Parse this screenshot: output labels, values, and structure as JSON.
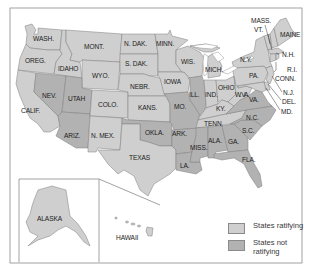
{
  "map": {
    "type": "choropleth",
    "subject": "United States",
    "colors": {
      "ratifying": "#cfcfcf",
      "not_ratifying": "#b2b2b2",
      "water": "#ffffff",
      "border": "#7c7c7c",
      "frame": "#8a8a8a"
    },
    "legend": {
      "items": [
        {
          "key": "ratifying",
          "label": "States ratifying"
        },
        {
          "key": "not_ratifying",
          "label": "States not ratifying"
        }
      ]
    },
    "states": [
      {
        "abbr": "WA",
        "label": "WASH.",
        "status": "ratifying"
      },
      {
        "abbr": "OR",
        "label": "OREG.",
        "status": "ratifying"
      },
      {
        "abbr": "CA",
        "label": "CALIF.",
        "status": "ratifying"
      },
      {
        "abbr": "ID",
        "label": "IDAHO",
        "status": "ratifying"
      },
      {
        "abbr": "NV",
        "label": "NEV.",
        "status": "not_ratifying"
      },
      {
        "abbr": "MT",
        "label": "MONT.",
        "status": "ratifying"
      },
      {
        "abbr": "WY",
        "label": "WYO.",
        "status": "ratifying"
      },
      {
        "abbr": "UT",
        "label": "UTAH",
        "status": "not_ratifying"
      },
      {
        "abbr": "AZ",
        "label": "ARIZ.",
        "status": "not_ratifying"
      },
      {
        "abbr": "CO",
        "label": "COLO.",
        "status": "ratifying"
      },
      {
        "abbr": "NM",
        "label": "N. MEX.",
        "status": "ratifying"
      },
      {
        "abbr": "ND",
        "label": "N. DAK.",
        "status": "ratifying"
      },
      {
        "abbr": "SD",
        "label": "S. DAK.",
        "status": "ratifying"
      },
      {
        "abbr": "NE",
        "label": "NEBR.",
        "status": "ratifying"
      },
      {
        "abbr": "KS",
        "label": "KANS.",
        "status": "ratifying"
      },
      {
        "abbr": "OK",
        "label": "OKLA.",
        "status": "not_ratifying"
      },
      {
        "abbr": "TX",
        "label": "TEXAS",
        "status": "ratifying"
      },
      {
        "abbr": "MN",
        "label": "MINN.",
        "status": "ratifying"
      },
      {
        "abbr": "IA",
        "label": "IOWA",
        "status": "ratifying"
      },
      {
        "abbr": "MO",
        "label": "MO.",
        "status": "not_ratifying"
      },
      {
        "abbr": "AR",
        "label": "ARK.",
        "status": "not_ratifying"
      },
      {
        "abbr": "LA",
        "label": "LA.",
        "status": "not_ratifying"
      },
      {
        "abbr": "WI",
        "label": "WIS.",
        "status": "ratifying"
      },
      {
        "abbr": "IL",
        "label": "ILL.",
        "status": "not_ratifying"
      },
      {
        "abbr": "MI",
        "label": "MICH.",
        "status": "ratifying"
      },
      {
        "abbr": "IN",
        "label": "IND.",
        "status": "ratifying"
      },
      {
        "abbr": "OH",
        "label": "OHIO",
        "status": "ratifying"
      },
      {
        "abbr": "KY",
        "label": "KY.",
        "status": "ratifying"
      },
      {
        "abbr": "TN",
        "label": "TENN.",
        "status": "ratifying"
      },
      {
        "abbr": "MS",
        "label": "MISS.",
        "status": "not_ratifying"
      },
      {
        "abbr": "AL",
        "label": "ALA.",
        "status": "not_ratifying"
      },
      {
        "abbr": "GA",
        "label": "GA.",
        "status": "not_ratifying"
      },
      {
        "abbr": "FL",
        "label": "FLA.",
        "status": "not_ratifying"
      },
      {
        "abbr": "SC",
        "label": "S.C.",
        "status": "not_ratifying"
      },
      {
        "abbr": "NC",
        "label": "N.C.",
        "status": "not_ratifying"
      },
      {
        "abbr": "VA",
        "label": "VA.",
        "status": "not_ratifying"
      },
      {
        "abbr": "WV",
        "label": "W. VA.",
        "status": "ratifying"
      },
      {
        "abbr": "PA",
        "label": "PA.",
        "status": "ratifying"
      },
      {
        "abbr": "NY",
        "label": "N.Y.",
        "status": "ratifying"
      },
      {
        "abbr": "VT",
        "label": "VT.",
        "status": "ratifying"
      },
      {
        "abbr": "NH",
        "label": "N.H.",
        "status": "ratifying"
      },
      {
        "abbr": "ME",
        "label": "MAINE",
        "status": "ratifying"
      },
      {
        "abbr": "MA",
        "label": "MASS.",
        "status": "ratifying"
      },
      {
        "abbr": "RI",
        "label": "R.I.",
        "status": "ratifying"
      },
      {
        "abbr": "CT",
        "label": "CONN.",
        "status": "ratifying"
      },
      {
        "abbr": "NJ",
        "label": "N.J.",
        "status": "ratifying"
      },
      {
        "abbr": "DE",
        "label": "DEL.",
        "status": "ratifying"
      },
      {
        "abbr": "MD",
        "label": "MD.",
        "status": "ratifying"
      },
      {
        "abbr": "AK",
        "label": "ALASKA",
        "status": "ratifying"
      },
      {
        "abbr": "HI",
        "label": "HAWAII",
        "status": "ratifying"
      }
    ]
  }
}
